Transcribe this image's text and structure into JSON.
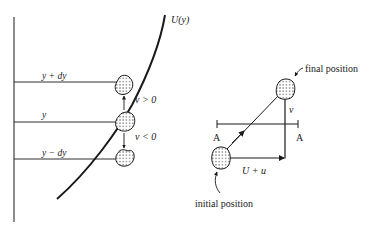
{
  "figure": {
    "left_panel": {
      "curve_label": "U(y)",
      "levels": [
        {
          "label": "y + dy"
        },
        {
          "label": "y"
        },
        {
          "label": "y − dy"
        }
      ],
      "velocity_labels": {
        "positive": "v > 0",
        "negative": "v < 0"
      }
    },
    "right_panel": {
      "plane_labels": {
        "left": "A",
        "right": "A"
      },
      "horizontal_component": "U + u",
      "vertical_component": "v",
      "final_label": "final position",
      "initial_label": "initial position"
    }
  },
  "colors": {
    "ink": "#1a1a1a",
    "background": "#ffffff"
  }
}
